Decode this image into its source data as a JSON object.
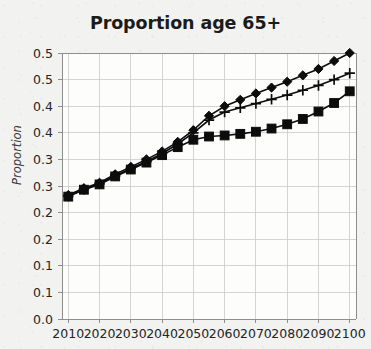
{
  "chart_data": {
    "type": "line",
    "title": "Proportion age 65+",
    "xlabel": "",
    "ylabel": "Proportion",
    "x": [
      2010,
      2015,
      2020,
      2025,
      2030,
      2035,
      2040,
      2045,
      2050,
      2055,
      2060,
      2065,
      2070,
      2075,
      2080,
      2085,
      2090,
      2095,
      2100
    ],
    "xlim": [
      2008,
      2102
    ],
    "ylim": [
      0.0,
      0.5
    ],
    "xticks": [
      2010,
      2020,
      2030,
      2040,
      2050,
      2060,
      2070,
      2080,
      2090,
      2100
    ],
    "xtick_labels": [
      "2010",
      "2020",
      "2030",
      "2040",
      "2050",
      "2060",
      "2070",
      "2080",
      "2090",
      "2100"
    ],
    "yticks": [
      0.0,
      0.05,
      0.1,
      0.15,
      0.2,
      0.25,
      0.3,
      0.35,
      0.4,
      0.45,
      0.5
    ],
    "ytick_labels": [
      "0.0",
      "0.1",
      "0.1",
      "0.2",
      "0.2",
      "0.3",
      "0.3",
      "0.4",
      "0.4",
      "0.5",
      "0.5"
    ],
    "grid": true,
    "legend": "none",
    "series": [
      {
        "name": "diamond-series",
        "marker": "diamond",
        "values": [
          0.233,
          0.246,
          0.256,
          0.272,
          0.286,
          0.3,
          0.315,
          0.333,
          0.355,
          0.382,
          0.4,
          0.412,
          0.424,
          0.435,
          0.446,
          0.458,
          0.47,
          0.485,
          0.5
        ]
      },
      {
        "name": "plus-series",
        "marker": "plus",
        "values": [
          0.231,
          0.244,
          0.254,
          0.269,
          0.283,
          0.296,
          0.311,
          0.329,
          0.35,
          0.374,
          0.389,
          0.397,
          0.405,
          0.413,
          0.421,
          0.43,
          0.439,
          0.45,
          0.462
        ]
      },
      {
        "name": "square-series",
        "marker": "square",
        "values": [
          0.23,
          0.243,
          0.253,
          0.268,
          0.281,
          0.294,
          0.308,
          0.323,
          0.337,
          0.343,
          0.345,
          0.348,
          0.352,
          0.358,
          0.366,
          0.376,
          0.39,
          0.406,
          0.428
        ]
      }
    ]
  },
  "figure": {
    "title": "Proportion age 65+",
    "y_axis_title": "Proportion"
  }
}
